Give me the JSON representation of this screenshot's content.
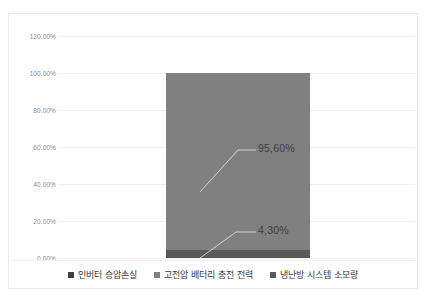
{
  "chart_data": {
    "type": "bar",
    "title": "",
    "subtitle": "",
    "xlabel": "",
    "ylabel": "",
    "categories": [
      ""
    ],
    "stacked": true,
    "grid": true,
    "legend_position": "bottom",
    "ylim": [
      0,
      120
    ],
    "ytick_labels": [
      "120.00%",
      "100.00%",
      "80.00%",
      "60.00%",
      "40.00%",
      "20.00%",
      "0.00%"
    ],
    "ytick_values": [
      120,
      100,
      80,
      60,
      40,
      20,
      0
    ],
    "series": [
      {
        "name": "인버터 승압손실",
        "values": [
          0.1
        ],
        "color": "#404040",
        "data_label": ""
      },
      {
        "name": "고전압 배터리 충전 전력",
        "values": [
          95.6
        ],
        "color": "#808080",
        "data_label": "95,60%"
      },
      {
        "name": "냉난방 시스템 소모량",
        "values": [
          4.3
        ],
        "color": "#595959",
        "data_label": "4,30%"
      }
    ],
    "annotations": [
      {
        "text": "95,60%",
        "value": 95.6
      },
      {
        "text": "4,30%",
        "value": 4.3
      }
    ]
  },
  "legend": {
    "items": [
      {
        "label": "인버터 승압손실"
      },
      {
        "label": "고전압 배터리 충전 전력"
      },
      {
        "label": "냉난방 시스템 소모량"
      }
    ]
  },
  "axis": {
    "y": {
      "t0": "120.00%",
      "t1": "100.00%",
      "t2": "80.00%",
      "t3": "60.00%",
      "t4": "40.00%",
      "t5": "20.00%",
      "t6": "0.00%"
    }
  },
  "labels": {
    "upper": "95,60%",
    "lower": "4,30%"
  }
}
